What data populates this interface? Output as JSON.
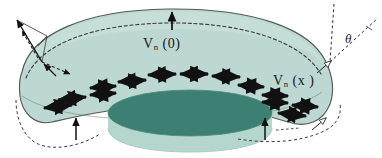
{
  "figure": {
    "background_color": "#ffffff",
    "width": 382,
    "height": 158
  },
  "colors": {
    "shell_fill": "#bdd8d2",
    "shell_fill_light": "#c9e0da",
    "shell_edge": "#555a57",
    "disk_top": "#3d8073",
    "disk_side": "#b5d6cd",
    "disk_edge": "#4a8a7c",
    "arrow": "#111111",
    "dashed": "#3a3a3a",
    "label_text": "#1a1a1a"
  },
  "labels": {
    "vn_zero": {
      "symbol": "V",
      "subscript": "n",
      "argument": "(0)",
      "text": "V n (0)"
    },
    "vn_x": {
      "symbol": "V",
      "subscript": "n",
      "argument": "(x )",
      "text": "V n (x )"
    },
    "theta": {
      "text": "θ"
    }
  },
  "annotations": {
    "top_normal_arrow": "upward-normal-arrow-at-apex",
    "left_vector_decomposition": "solid-normal-arrow-with-dashed-components",
    "right_angle_marker": "theta-between-vertical-dashed-and-slanted-dashed",
    "hollow_arrowheads": 2,
    "bottom_callout_arrows": 2
  },
  "double_arrows": {
    "description": "double-headed tangential arrows along shell-disk contact",
    "count": 14
  }
}
